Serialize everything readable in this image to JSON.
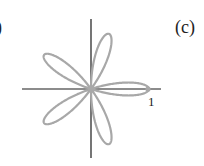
{
  "figure": {
    "panel_label": "(c)",
    "previous_panel_fragment": ")",
    "tick_label": "1",
    "curve": {
      "type": "polar-rose",
      "equation": "r = cos(5θ)",
      "petals": 5,
      "color": "#a8a8a8"
    },
    "axes_color": "#1a1a1a"
  },
  "chart_data": {
    "type": "line",
    "title": "(c)",
    "xlabel": "",
    "ylabel": "",
    "annotations": [
      "1"
    ],
    "curve": "polar rose r = cos(5θ), 5 petals, max radius 1 along positive x-axis",
    "xlim": [
      -1.2,
      1.2
    ],
    "ylim": [
      -1.2,
      1.2
    ],
    "grid": false
  }
}
